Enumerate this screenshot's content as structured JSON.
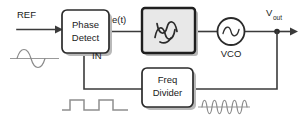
{
  "diagram": {
    "type": "block-diagram",
    "canvas": {
      "width": 304,
      "height": 126,
      "background": "#ffffff"
    },
    "colors": {
      "wire": "#3b3b3b",
      "block_border": "#2b2b2b",
      "block_fill": "#ffffff",
      "filter_block_fill": "#e8e8e8",
      "block_shadow": "#b9b9b9",
      "waveform": "#8a8a8a",
      "text": "#1a1a1a"
    },
    "blocks": [
      {
        "id": "phase-detect",
        "line1": "Phase",
        "line2": "Detect",
        "fill": "#ffffff"
      },
      {
        "id": "loop-filter",
        "line1": "",
        "line2": "",
        "glyph": "filter-wave-glyph",
        "fill": "#e8e8e8"
      },
      {
        "id": "freq-divider",
        "line1": "Freq",
        "line2": "Divider",
        "fill": "#ffffff"
      }
    ],
    "components": [
      {
        "id": "vco",
        "label": "VCO",
        "shape": "circle",
        "glyph": "sine-source-glyph"
      }
    ],
    "signal_labels": [
      {
        "id": "ref",
        "text": "REF"
      },
      {
        "id": "error",
        "text": "e(t)"
      },
      {
        "id": "in",
        "text": "IN"
      },
      {
        "id": "vout-main",
        "text": "V"
      },
      {
        "id": "vout-sub",
        "text": "out"
      }
    ],
    "waveforms": [
      {
        "id": "ref-sine",
        "kind": "sine",
        "cycles": 1,
        "description": "reference sine wave"
      },
      {
        "id": "divider-square",
        "kind": "square",
        "cycles": 2,
        "description": "divided square wave"
      },
      {
        "id": "vco-sine-burst",
        "kind": "sine",
        "cycles": 4.5,
        "description": "high frequency VCO output"
      }
    ]
  }
}
